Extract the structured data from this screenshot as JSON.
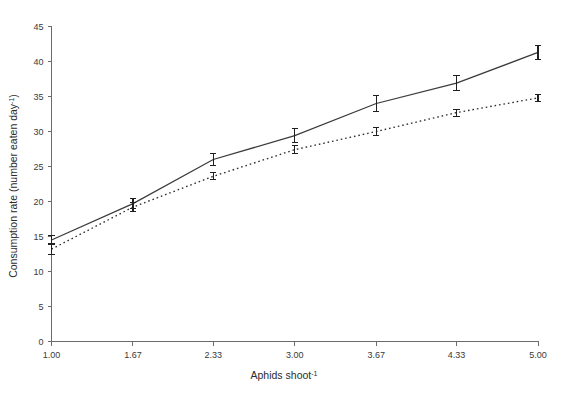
{
  "chart_data": {
    "type": "line",
    "title": "",
    "subtitle": "",
    "xlabel": "Aphids shoot",
    "xlabel_sup": "-1",
    "ylabel": "Consumption rate (number eaten day",
    "ylabel_sup": "-1",
    "ylabel_close": ")",
    "x": [
      1.0,
      1.67,
      2.33,
      3.0,
      3.67,
      4.33,
      5.0
    ],
    "xticklabels": [
      "1.00",
      "1.67",
      "2.33",
      "3.00",
      "3.67",
      "4.33",
      "5.00"
    ],
    "yticklabels": [
      "0",
      "5",
      "10",
      "15",
      "20",
      "25",
      "30",
      "35",
      "40",
      "45"
    ],
    "yticks": [
      0,
      5,
      10,
      15,
      20,
      25,
      30,
      35,
      40,
      45
    ],
    "xlim": [
      1.0,
      5.0
    ],
    "ylim": [
      0,
      45
    ],
    "grid": false,
    "legend": "none",
    "series": [
      {
        "name": "solid-line-series",
        "style": "solid",
        "values": [
          14.5,
          19.7,
          26.0,
          29.4,
          34.0,
          36.9,
          41.3
        ],
        "errors": [
          0.7,
          0.7,
          0.9,
          1.0,
          1.1,
          1.1,
          1.0
        ]
      },
      {
        "name": "dotted-line-series",
        "style": "dotted",
        "values": [
          13.2,
          19.2,
          23.6,
          27.4,
          30.0,
          32.7,
          34.8
        ],
        "errors": [
          0.8,
          0.6,
          0.5,
          0.6,
          0.6,
          0.5,
          0.5
        ]
      }
    ]
  }
}
